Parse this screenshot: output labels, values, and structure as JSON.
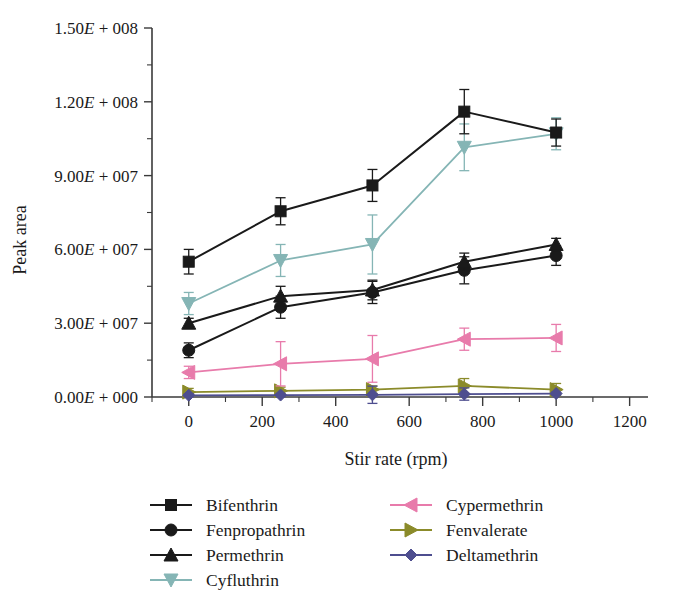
{
  "chart_data": {
    "type": "line",
    "title": "",
    "xlabel": "Stir rate (rpm)",
    "ylabel": "Peak area",
    "x": [
      0,
      250,
      500,
      750,
      1000
    ],
    "xlim": [
      -100,
      1250
    ],
    "ylim": [
      0,
      150000000
    ],
    "xticks": [
      0,
      200,
      400,
      600,
      800,
      1000,
      1200
    ],
    "xticklabels": [
      "0",
      "200",
      "400",
      "600",
      "800",
      "1000",
      "1200"
    ],
    "yticks": [
      0,
      30000000,
      60000000,
      90000000,
      120000000,
      150000000
    ],
    "yticklabels": [
      "0.00E + 000",
      "3.00E + 007",
      "6.00E + 007",
      "9.00E + 007",
      "1.20E + 008",
      "1.50E + 008"
    ],
    "x_minor_interval": 100,
    "y_minor_interval": 15000000,
    "grid": false,
    "legend_position": "below-plot",
    "series": [
      {
        "name": "Bifenthrin",
        "color": "#1a1a1a",
        "marker": "square",
        "values": [
          55000000,
          75500000,
          86000000,
          116000000,
          107500000
        ],
        "errors": [
          5000000,
          5500000,
          6500000,
          9000000,
          5500000
        ]
      },
      {
        "name": "Fenpropathrin",
        "color": "#1a1a1a",
        "marker": "circle",
        "values": [
          19000000,
          36500000,
          42500000,
          51500000,
          57500000
        ],
        "errors": [
          3000000,
          4500000,
          4500000,
          5500000,
          4000000
        ]
      },
      {
        "name": "Permethrin",
        "color": "#1a1a1a",
        "marker": "triangle-up",
        "values": [
          30000000,
          41000000,
          43500000,
          55000000,
          62000000
        ],
        "errors": [
          2000000,
          4000000,
          4000000,
          3500000,
          2500000
        ]
      },
      {
        "name": "Cyfluthrin",
        "color": "#85b5b5",
        "marker": "triangle-down",
        "values": [
          38000000,
          55500000,
          62000000,
          101500000,
          107000000
        ],
        "errors": [
          4500000,
          6500000,
          12000000,
          9500000,
          6500000
        ]
      },
      {
        "name": "Cypermethrin",
        "color": "#e87bab",
        "marker": "triangle-left",
        "values": [
          10000000,
          13500000,
          15500000,
          23500000,
          24000000
        ],
        "errors": [
          2500000,
          9000000,
          9500000,
          4500000,
          5500000
        ]
      },
      {
        "name": "Fenvalerate",
        "color": "#8b8b2a",
        "marker": "triangle-right",
        "values": [
          2000000,
          2500000,
          3000000,
          4500000,
          3000000
        ],
        "errors": [
          1500000,
          1500000,
          1500000,
          3000000,
          2500000
        ]
      },
      {
        "name": "Deltamethrin",
        "color": "#4e4e8f",
        "marker": "diamond",
        "values": [
          700000,
          800000,
          900000,
          1200000,
          1400000
        ],
        "errors": [
          600000,
          600000,
          3500000,
          2500000,
          600000
        ]
      }
    ]
  },
  "legend": {
    "left_column": [
      "Bifenthrin",
      "Fenpropathrin",
      "Permethrin",
      "Cyfluthrin"
    ],
    "right_column": [
      "Cypermethrin",
      "Fenvalerate",
      "Deltamethrin"
    ]
  }
}
